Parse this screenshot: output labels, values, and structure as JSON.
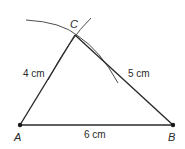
{
  "diagram": {
    "type": "triangle-construction",
    "vertices": {
      "A": {
        "label": "A"
      },
      "B": {
        "label": "B"
      },
      "C": {
        "label": "C"
      }
    },
    "sides": {
      "AB": {
        "label": "6 cm"
      },
      "AC": {
        "label": "4 cm"
      },
      "BC": {
        "label": "5 cm"
      }
    },
    "colors": {
      "line": "#2a2a2a",
      "arc": "#3a3a3a"
    }
  }
}
